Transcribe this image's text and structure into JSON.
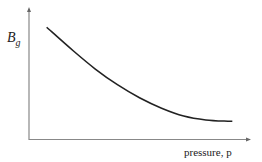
{
  "chart_data": {
    "type": "line",
    "title": "",
    "xlabel": "pressure, p",
    "ylabel_main": "B",
    "ylabel_sub": "g",
    "xlim": [
      0,
      1
    ],
    "ylim": [
      0,
      1
    ],
    "grid": false,
    "legend": "none",
    "series": [
      {
        "name": "Bg vs p",
        "x": [
          0.08,
          0.2,
          0.3,
          0.4,
          0.5,
          0.6,
          0.7,
          0.8,
          0.9,
          0.92
        ],
        "y": [
          0.86,
          0.68,
          0.54,
          0.42,
          0.32,
          0.24,
          0.18,
          0.15,
          0.14,
          0.14
        ]
      }
    ]
  },
  "colors": {
    "axis": "#888888",
    "curve": "#222222"
  }
}
